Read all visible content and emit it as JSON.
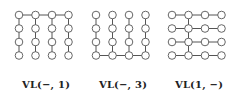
{
  "figure": {
    "panels": [
      {
        "label": "VL(−, 1)",
        "connect": "row",
        "index": 1,
        "description": "4x4 grid, vertical lines in all columns, horizontal line along row 2"
      },
      {
        "label": "VL(−, 3)",
        "connect": "row",
        "index": 4,
        "description": "4x4 grid, vertical lines in all columns, horizontal line along bottom row"
      },
      {
        "label": "VL(1, −)",
        "connect": "col",
        "index": 2,
        "description": "4x4 grid, horizontal lines in all rows, vertical line along column 2"
      }
    ],
    "grid_size": 4,
    "colors": {
      "node_stroke": "#555555",
      "edge": "#555555",
      "node_fill": "#ffffff"
    }
  }
}
